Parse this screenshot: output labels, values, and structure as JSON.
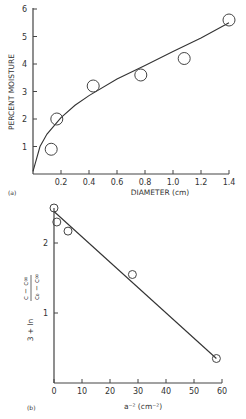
{
  "chart_data": [
    {
      "type": "scatter",
      "panel_label": "(a)",
      "title": "",
      "xlabel": "DIAMETER (cm)",
      "ylabel": "PERCENT MOISTURE",
      "xlim": [
        0,
        1.4
      ],
      "ylim": [
        0,
        6
      ],
      "xticks": [
        "0.2",
        "0.4",
        "0.6",
        "0.8",
        "1.0",
        "1.2",
        "1.4"
      ],
      "yticks": [
        "1",
        "2",
        "3",
        "4",
        "5",
        "6"
      ],
      "grid": false,
      "series": [
        {
          "name": "data",
          "marker": "open-circle",
          "x": [
            0.13,
            0.17,
            0.43,
            0.77,
            1.08,
            1.4
          ],
          "y": [
            0.9,
            2.0,
            3.2,
            3.6,
            4.2,
            5.6
          ]
        },
        {
          "name": "fit",
          "style": "line",
          "x": [
            0.0,
            0.05,
            0.1,
            0.2,
            0.3,
            0.4,
            0.6,
            0.8,
            1.0,
            1.2,
            1.4
          ],
          "y": [
            0.1,
            1.0,
            1.45,
            2.05,
            2.5,
            2.85,
            3.45,
            3.95,
            4.45,
            4.95,
            5.5
          ]
        }
      ]
    },
    {
      "type": "scatter",
      "panel_label": "(b)",
      "title": "",
      "xlabel": "a⁻² (cm⁻²)",
      "ylabel": "3 + ln (c − c∞)/(c₀ − c∞)",
      "xlim": [
        0,
        60
      ],
      "ylim": [
        0,
        2.5
      ],
      "xticks": [
        "0",
        "10",
        "20",
        "30",
        "40",
        "50",
        "60"
      ],
      "yticks": [
        "1",
        "2"
      ],
      "grid": false,
      "series": [
        {
          "name": "data",
          "marker": "open-circle",
          "x": [
            0,
            1,
            5,
            28,
            58
          ],
          "y": [
            2.5,
            2.3,
            2.17,
            1.55,
            0.35
          ]
        },
        {
          "name": "fit",
          "style": "line",
          "x": [
            0,
            58
          ],
          "y": [
            2.45,
            0.35
          ]
        }
      ]
    }
  ]
}
